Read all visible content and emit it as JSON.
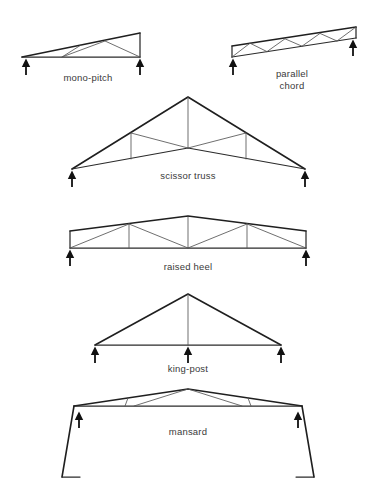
{
  "figure": {
    "background_color": "#ffffff",
    "line_color": "#2b2b2b",
    "web_color": "#555555",
    "label_color": "#3a3a3a",
    "support_color": "#111111",
    "width": 370,
    "height": 490
  },
  "trusses": [
    {
      "id": "mono-pitch",
      "label": "mono-pitch",
      "label_lines": [
        "mono-pitch"
      ],
      "support_count": 2,
      "description": "Sloping top chord from low left to high right, horizontal bottom chord, vertical right end, W web pattern"
    },
    {
      "id": "parallel-chord",
      "label": "parallel chord",
      "label_lines": [
        "parallel",
        "chord"
      ],
      "support_count": 2,
      "description": "Inclined parallel top and bottom chords with zigzag Warren web members and vertical ends"
    },
    {
      "id": "scissor-truss",
      "label": "scissor truss",
      "label_lines": [
        "scissor truss"
      ],
      "support_count": 2,
      "description": "Gable top chord with raised inverted-V bottom chord, central vertical post, side verticals and diagonals"
    },
    {
      "id": "raised-heel",
      "label": "raised heel",
      "label_lines": [
        "raised heel"
      ],
      "support_count": 2,
      "description": "Shallow gable with vertical heel blocks at bearings, flat bottom chord and W web pattern"
    },
    {
      "id": "king-post",
      "label": "king-post",
      "label_lines": [
        "king-post"
      ],
      "support_count": 3,
      "description": "Simple triangle with single central vertical king post and three supports"
    },
    {
      "id": "mansard",
      "label": "mansard",
      "label_lines": [
        "mansard"
      ],
      "support_count": 2,
      "description": "Shallow upper truss on flat bottom chord with steep outward-sloping side legs ending in small feet"
    }
  ]
}
